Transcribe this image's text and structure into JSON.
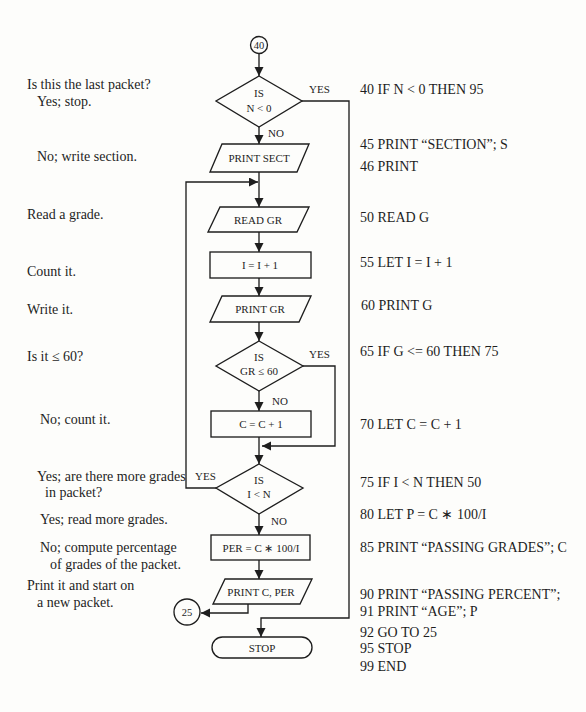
{
  "flowchart": {
    "start_connector": "40",
    "end_connector": "25",
    "decision_last_packet": {
      "line1": "IS",
      "line2": "N < 0",
      "yes": "YES",
      "no": "NO"
    },
    "print_sect": "PRINT SECT",
    "read_gr": "READ GR",
    "increment_i": "I = I + 1",
    "print_gr": "PRINT GR",
    "decision_grade": {
      "line1": "IS",
      "line2": "GR ≤ 60",
      "yes": "YES",
      "no": "NO"
    },
    "increment_c": "C = C + 1",
    "decision_more": {
      "line1": "IS",
      "line2": "I < N",
      "yes": "YES",
      "no": "NO"
    },
    "compute_per": "PER = C ∗ 100/I",
    "print_c_per": "PRINT C, PER",
    "stop": "STOP"
  },
  "annotations": [
    "Is this the last packet?",
    "Yes; stop.",
    "No; write section.",
    "Read a grade.",
    "Count it.",
    "Write it.",
    "Is it ≤ 60?",
    "No; count it.",
    "Yes; are there more grades",
    "in packet?",
    "Yes; read more grades.",
    "No; compute percentage",
    "of grades of the packet.",
    "Print it and start on",
    "a new packet."
  ],
  "program": [
    "40 IF N < 0 THEN 95",
    "45 PRINT “SECTION”; S",
    "46 PRINT",
    "50 READ G",
    "55 LET I = I + 1",
    "60 PRINT G",
    "65 IF G <= 60 THEN 75",
    "70 LET C = C + 1",
    "75 IF I < N THEN 50",
    "80 LET P = C ∗ 100/I",
    "85 PRINT “PASSING GRADES”; C",
    "90 PRINT “PASSING PERCENT”;",
    "91 PRINT “AGE”; P",
    "92 GO TO 25",
    "95 STOP",
    "99 END"
  ]
}
